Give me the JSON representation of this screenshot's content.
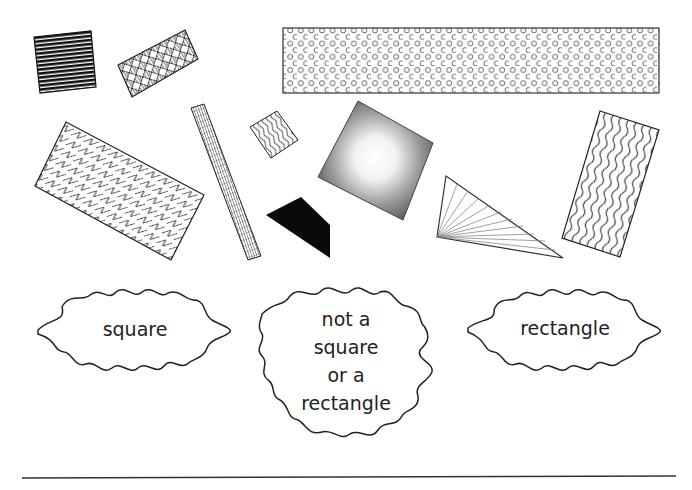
{
  "worksheet": {
    "shapes": [
      {
        "id": "striped-square",
        "kind": "square",
        "pattern": "horizontal-stripes"
      },
      {
        "id": "patterned-rectangle",
        "kind": "rectangle",
        "pattern": "diamond-texture"
      },
      {
        "id": "dotted-long-rectangle",
        "kind": "rectangle",
        "pattern": "circles"
      },
      {
        "id": "zigzag-rectangle",
        "kind": "rectangle",
        "pattern": "zigzag"
      },
      {
        "id": "grid-strip",
        "kind": "rectangle",
        "pattern": "grid"
      },
      {
        "id": "small-wavy-square",
        "kind": "square",
        "pattern": "waves"
      },
      {
        "id": "shaded-square",
        "kind": "square",
        "pattern": "radial-gradient"
      },
      {
        "id": "black-trapezoid",
        "kind": "quadrilateral",
        "pattern": "solid-black"
      },
      {
        "id": "fan-triangle",
        "kind": "triangle",
        "pattern": "fan-lines"
      },
      {
        "id": "wavy-rectangle",
        "kind": "rectangle",
        "pattern": "waves"
      }
    ],
    "sort_labels": {
      "square": "square",
      "neither": [
        "not a",
        "square",
        "or a",
        "rectangle"
      ],
      "rectangle": "rectangle"
    },
    "colors": {
      "ink": "#222222",
      "background": "#ffffff"
    }
  }
}
